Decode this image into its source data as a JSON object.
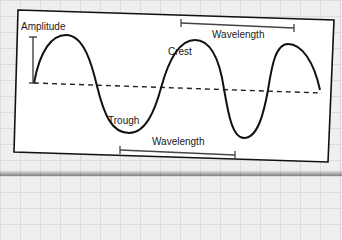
{
  "diagram": {
    "labels": {
      "amplitude": "Amplitude",
      "crest": "Crest",
      "trough": "Trough",
      "wavelength_top": "Wavelength",
      "wavelength_bottom": "Wavelength"
    },
    "colors": {
      "background_paper": "#efefef",
      "grid_lines": "#dcdcdc",
      "card": "#ffffff",
      "stroke": "#1a1a1a",
      "measure_bar": "#444444"
    }
  }
}
